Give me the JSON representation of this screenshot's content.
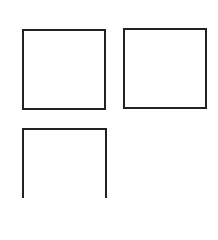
{
  "diagram": {
    "type": "grid-of-empty-boxes",
    "border_color": "#222222",
    "background_color": "#ffffff",
    "boxes": [
      {
        "id": "box-1",
        "row": 1,
        "col": 1,
        "label": ""
      },
      {
        "id": "box-2",
        "row": 1,
        "col": 2,
        "label": ""
      },
      {
        "id": "box-3",
        "row": 2,
        "col": 1,
        "label": ""
      }
    ]
  }
}
